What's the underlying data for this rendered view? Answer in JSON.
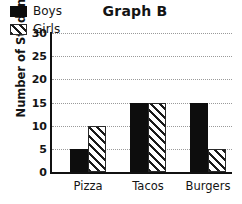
{
  "chart_data": {
    "type": "bar",
    "title": "Graph B",
    "xlabel": "",
    "ylabel": "Number of Students",
    "categories": [
      "Pizza",
      "Tacos",
      "Burgers"
    ],
    "series": [
      {
        "name": "Boys",
        "values": [
          5,
          15,
          15
        ],
        "style": "solid-black",
        "color": "#0d0d0d"
      },
      {
        "name": "Girls",
        "values": [
          10,
          15,
          5
        ],
        "style": "diagonal-hatch",
        "color": "#ffffff"
      }
    ],
    "ylim": [
      0,
      30
    ],
    "ytick_labels": [
      "0",
      "5",
      "10",
      "15",
      "20",
      "25",
      "30"
    ],
    "ytick_values": [
      0,
      5,
      10,
      15,
      20,
      25,
      30
    ],
    "grid": true,
    "grid_style": "dotted",
    "grid_color": "#9a9a9a",
    "legend_position": "top-left-inside"
  }
}
